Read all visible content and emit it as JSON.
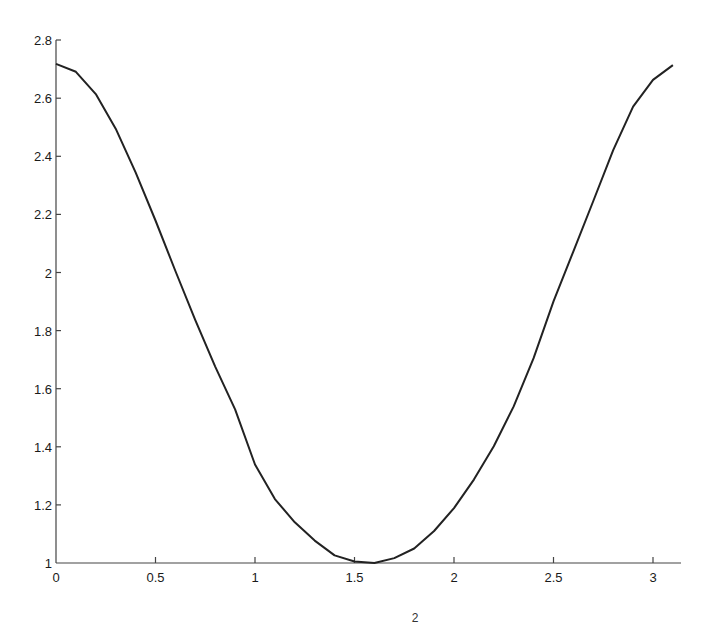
{
  "chart_data": {
    "type": "line",
    "title": "",
    "xlabel": "",
    "ylabel": "",
    "xlim": [
      0,
      3.14
    ],
    "ylim": [
      1,
      2.8
    ],
    "grid": false,
    "legend": null,
    "x_ticks": [
      "0",
      "0.5",
      "1",
      "1.5",
      "2",
      "2.5",
      "3"
    ],
    "y_ticks": [
      "1",
      "1.2",
      "1.4",
      "1.6",
      "1.8",
      "2",
      "2.2",
      "2.4",
      "2.6",
      "2.8"
    ],
    "annotations": [
      "2"
    ],
    "series": [
      {
        "name": "f(x)",
        "color": "#222222",
        "x": [
          0,
          0.1,
          0.2,
          0.3,
          0.4,
          0.5,
          0.6,
          0.7,
          0.8,
          0.9,
          1.0,
          1.1,
          1.2,
          1.3,
          1.4,
          1.5,
          1.6,
          1.7,
          1.8,
          1.9,
          2.0,
          2.1,
          2.2,
          2.3,
          2.4,
          2.5,
          2.6,
          2.7,
          2.8,
          2.9,
          3.0,
          3.1
        ],
        "values": [
          2.718,
          2.691,
          2.614,
          2.495,
          2.345,
          2.179,
          2.005,
          1.836,
          1.676,
          1.529,
          1.339,
          1.22,
          1.14,
          1.077,
          1.026,
          1.005,
          1.0,
          1.017,
          1.05,
          1.11,
          1.189,
          1.287,
          1.402,
          1.539,
          1.705,
          1.901,
          2.073,
          2.246,
          2.421,
          2.571,
          2.663,
          2.714
        ]
      }
    ]
  },
  "axis": {
    "bottom_label_fragment": "2"
  }
}
